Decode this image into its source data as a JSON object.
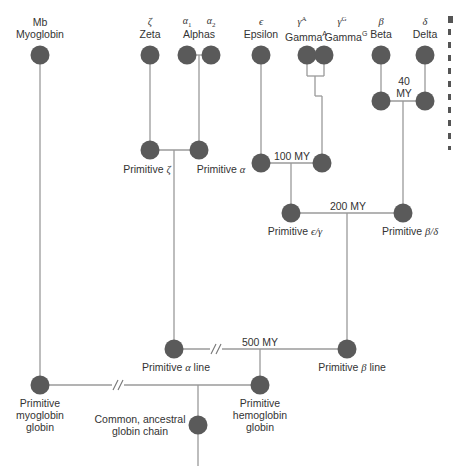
{
  "diagram": {
    "type": "phylogenetic-tree",
    "colors": {
      "node": "#5a5a5a",
      "line": "#9a9a9a",
      "text": "#333333",
      "background": "#ffffff"
    },
    "leaves": {
      "mb": {
        "symbol": "Mb",
        "name": "Myoglobin"
      },
      "zeta": {
        "symbol": "ζ",
        "name": "Zeta"
      },
      "alphas": {
        "symbol1": "α",
        "sub1": "1",
        "symbol2": "α",
        "sub2": "2",
        "name": "Alphas"
      },
      "epsilon": {
        "symbol": "ϵ",
        "name": "Epsilon"
      },
      "gamma_a": {
        "symbol": "γ",
        "sup": "A",
        "name": "Gamma",
        "name_sup": "A"
      },
      "gamma_g": {
        "symbol": "γ",
        "sup": "G",
        "name": "Gamma",
        "name_sup": "G"
      },
      "beta": {
        "symbol": "β",
        "name": "Beta"
      },
      "delta": {
        "symbol": "δ",
        "name": "Delta"
      }
    },
    "internal_nodes": {
      "prim_zeta": {
        "prefix": "Primitive ",
        "greek": "ζ"
      },
      "prim_alpha": {
        "prefix": "Primitive ",
        "greek": "α"
      },
      "prim_eps_gamma": {
        "prefix": "Primitive ",
        "greek": "ϵ/γ"
      },
      "prim_beta_delta": {
        "prefix": "Primitive ",
        "greek": "β/δ"
      },
      "prim_alpha_line": {
        "prefix": "Primitive ",
        "greek": "α",
        "suffix": " line"
      },
      "prim_beta_line": {
        "prefix": "Primitive ",
        "greek": "β",
        "suffix": " line"
      },
      "prim_myoglobin": {
        "line1": "Primitive",
        "line2": "myoglobin",
        "line3": "globin"
      },
      "prim_hemoglobin": {
        "line1": "Primitive",
        "line2": "hemoglobin",
        "line3": "globin"
      },
      "common": {
        "line1": "Common, ancestral",
        "line2": "globin chain"
      }
    },
    "divergence_times": {
      "beta_delta": {
        "line1": "40",
        "line2": "MY"
      },
      "epsilon_gamma": "100 MY",
      "eps_gamma_vs_beta_delta": "200 MY",
      "alpha_vs_beta": "500 MY"
    }
  }
}
